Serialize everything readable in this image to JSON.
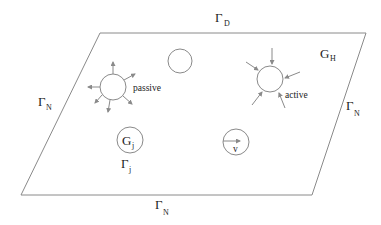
{
  "diagram": {
    "type": "domain-schematic",
    "domain": {
      "shape": "parallelogram",
      "corners": [
        [
          100,
          33
        ],
        [
          366,
          33
        ],
        [
          312,
          195
        ],
        [
          21,
          195
        ]
      ],
      "region_label": {
        "main": "G",
        "sub": "H"
      }
    },
    "boundaries": {
      "top": {
        "main": "Γ",
        "sub": "D"
      },
      "left": {
        "main": "Γ",
        "sub": "N"
      },
      "right": {
        "main": "Γ",
        "sub": "N"
      },
      "bottom": {
        "main": "Γ",
        "sub": "N"
      }
    },
    "inclusions": {
      "passive": {
        "label": "passive",
        "cx": 113,
        "cy": 87,
        "r": 13,
        "arrows": "outward"
      },
      "plain": {
        "cx": 180,
        "cy": 61,
        "r": 12
      },
      "active": {
        "label": "active",
        "cx": 270,
        "cy": 79,
        "r": 13,
        "arrows": "inward"
      },
      "gj": {
        "main": "G",
        "sub": "j",
        "boundary_main": "Γ",
        "boundary_sub": "j",
        "cx": 130,
        "cy": 140,
        "r": 13
      },
      "velocity": {
        "label": "v",
        "cx": 236,
        "cy": 142,
        "r": 13
      }
    },
    "colors": {
      "line": "#8a8a8a",
      "text": "#222222",
      "background": "#ffffff"
    }
  }
}
